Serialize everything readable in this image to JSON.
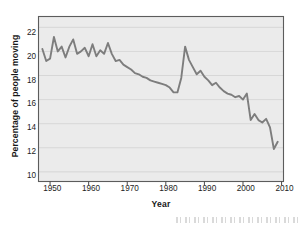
{
  "chart_data": {
    "type": "line",
    "title": "",
    "xlabel": "Year",
    "ylabel": "Percentage of people moving",
    "xlim": [
      1947,
      2010.5
    ],
    "ylim": [
      9.2,
      22.9
    ],
    "xticks": [
      1950,
      1960,
      1970,
      1980,
      1990,
      2000,
      2010
    ],
    "yticks": [
      10,
      12,
      14,
      16,
      18,
      20,
      22
    ],
    "grid": "horizontal",
    "legend": "none",
    "line_color": "#7d7d7d",
    "plot_background": "#ebebeb",
    "x": [
      1948,
      1949,
      1950,
      1951,
      1952,
      1953,
      1954,
      1955,
      1956,
      1957,
      1958,
      1959,
      1960,
      1961,
      1962,
      1963,
      1964,
      1965,
      1966,
      1967,
      1968,
      1969,
      1970,
      1971,
      1972,
      1973,
      1974,
      1975,
      1976,
      1977,
      1978,
      1979,
      1980,
      1981,
      1982,
      1983,
      1984,
      1985,
      1986,
      1987,
      1988,
      1989,
      1990,
      1991,
      1992,
      1993,
      1994,
      1995,
      1996,
      1997,
      1998,
      1999,
      2000,
      2001,
      2002,
      2003,
      2004,
      2005,
      2006,
      2007,
      2008,
      2009
    ],
    "values": [
      20.2,
      19.2,
      19.4,
      21.2,
      20.0,
      20.4,
      19.5,
      20.4,
      21.0,
      19.8,
      20.0,
      20.3,
      19.6,
      20.6,
      19.6,
      20.1,
      19.8,
      20.7,
      19.8,
      19.2,
      19.3,
      18.9,
      18.7,
      18.5,
      18.2,
      18.1,
      17.9,
      17.8,
      17.6,
      17.5,
      17.4,
      17.3,
      17.2,
      17.0,
      16.6,
      16.6,
      17.8,
      20.4,
      19.3,
      18.7,
      18.1,
      18.4,
      17.9,
      17.6,
      17.2,
      17.4,
      17.0,
      16.7,
      16.5,
      16.4,
      16.2,
      16.3,
      16.0,
      16.5,
      14.3,
      14.8,
      14.3,
      14.1,
      14.4,
      13.7,
      11.9,
      12.5
    ]
  },
  "axis": {
    "ytick_labels": [
      "22",
      "20",
      "18",
      "16",
      "14",
      "12",
      "10"
    ],
    "xtick_labels": [
      "1950",
      "1960",
      "1970",
      "1980",
      "1990",
      "2000",
      "2010"
    ]
  },
  "artifact": {
    "bottom_scan_text": ""
  }
}
